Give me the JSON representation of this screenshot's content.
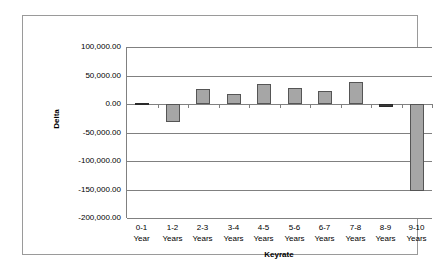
{
  "chart_data": {
    "type": "bar",
    "title": "",
    "xlabel": "Keyrate",
    "ylabel": "Delta",
    "categories": [
      "0-1 Year",
      "1-2 Years",
      "2-3 Years",
      "3-4 Years",
      "4-5 Years",
      "5-6 Years",
      "6-7 Years",
      "7-8 Years",
      "8-9 Years",
      "9-10 Years"
    ],
    "category_lines": [
      [
        "0-1",
        "Year"
      ],
      [
        "1-2",
        "Years"
      ],
      [
        "2-3",
        "Years"
      ],
      [
        "3-4",
        "Years"
      ],
      [
        "4-5",
        "Years"
      ],
      [
        "5-6",
        "Years"
      ],
      [
        "6-7",
        "Years"
      ],
      [
        "7-8",
        "Years"
      ],
      [
        "8-9",
        "Years"
      ],
      [
        "9-10",
        "Years"
      ]
    ],
    "values": [
      1000,
      -31000,
      26000,
      18000,
      34500,
      28000,
      23000,
      38000,
      -4500,
      -153000
    ],
    "ylim": [
      -200000,
      100000
    ],
    "ytick_values": [
      100000,
      50000,
      0,
      -50000,
      -100000,
      -150000,
      -200000
    ],
    "ytick_labels": [
      "100,000.00",
      "50,000.00",
      "0.00",
      "-50,000.00",
      "-100,000.00",
      "-150,000.00",
      "-200,000.00"
    ],
    "grid": true,
    "grid_axis": "y",
    "legend": false,
    "bar_color": "#a6a6a6",
    "bar_border_color": "#555555",
    "gridline_color": "#808080",
    "plot_background": "#ffffff",
    "frame_border_color": "#9a9a9a"
  }
}
